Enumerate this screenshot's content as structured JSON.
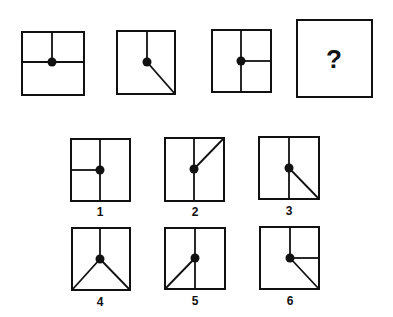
{
  "puzzle": {
    "stroke_color": "#111111",
    "background": "#ffffff",
    "question_mark": "?",
    "sequence": [
      {
        "name": "sequence-figure-1",
        "box": [
          22,
          32,
          84,
          95
        ],
        "dot": [
          52,
          62
        ],
        "lines": [
          [
            52,
            32,
            52,
            62
          ],
          [
            22,
            62,
            84,
            62
          ]
        ]
      },
      {
        "name": "sequence-figure-2",
        "box": [
          117,
          31,
          175,
          94
        ],
        "dot": [
          147,
          62
        ],
        "lines": [
          [
            147,
            31,
            147,
            62
          ],
          [
            147,
            62,
            175,
            94
          ]
        ]
      },
      {
        "name": "sequence-figure-3",
        "box": [
          212,
          30,
          271,
          92
        ],
        "dot": [
          241,
          61
        ],
        "lines": [
          [
            241,
            30,
            241,
            92
          ],
          [
            241,
            61,
            271,
            61
          ]
        ]
      }
    ],
    "question_box": {
      "box": [
        297,
        20,
        372,
        97
      ],
      "mark_pos": [
        326,
        46
      ]
    },
    "options": [
      {
        "label": "1",
        "box": [
          71,
          139,
          130,
          201
        ],
        "dot": [
          100,
          170
        ],
        "label_pos": [
          100,
          206
        ],
        "lines": [
          [
            100,
            139,
            100,
            201
          ],
          [
            71,
            170,
            100,
            170
          ]
        ]
      },
      {
        "label": "2",
        "box": [
          165,
          138,
          224,
          201
        ],
        "dot": [
          194,
          169
        ],
        "label_pos": [
          195,
          206
        ],
        "lines": [
          [
            194,
            138,
            194,
            201
          ],
          [
            194,
            169,
            224,
            138
          ]
        ]
      },
      {
        "label": "3",
        "box": [
          259,
          137,
          319,
          199
        ],
        "dot": [
          289,
          168
        ],
        "label_pos": [
          289,
          205
        ],
        "lines": [
          [
            289,
            137,
            289,
            199
          ],
          [
            289,
            168,
            319,
            199
          ]
        ]
      },
      {
        "label": "4",
        "box": [
          72,
          228,
          130,
          290
        ],
        "dot": [
          100,
          259
        ],
        "label_pos": [
          100,
          296
        ],
        "lines": [
          [
            100,
            228,
            100,
            259
          ],
          [
            100,
            259,
            72,
            290
          ],
          [
            100,
            259,
            130,
            290
          ]
        ]
      },
      {
        "label": "5",
        "box": [
          165,
          228,
          225,
          289
        ],
        "dot": [
          195,
          258
        ],
        "label_pos": [
          195,
          295
        ],
        "lines": [
          [
            195,
            228,
            195,
            289
          ],
          [
            195,
            258,
            165,
            289
          ]
        ]
      },
      {
        "label": "6",
        "box": [
          260,
          227,
          319,
          289
        ],
        "dot": [
          290,
          258
        ],
        "label_pos": [
          290,
          295
        ],
        "lines": [
          [
            290,
            227,
            290,
            258
          ],
          [
            290,
            258,
            319,
            258
          ],
          [
            290,
            258,
            319,
            289
          ]
        ]
      }
    ]
  }
}
